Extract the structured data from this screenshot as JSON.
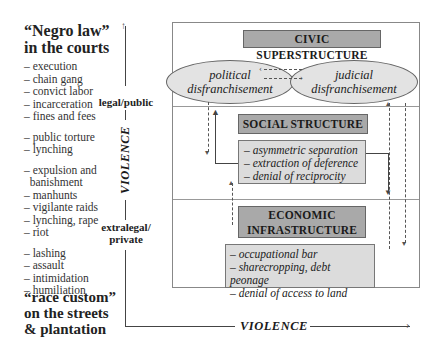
{
  "left_panel": {
    "top_heading": [
      "“Negro law”",
      "in the courts"
    ],
    "groups": [
      [
        "– execution",
        "– chain gang",
        "– convict labor",
        "– incarceration",
        "– fines and fees"
      ],
      [
        "– public torture",
        "– lynching"
      ],
      [
        "– expulsion and",
        "  banishment",
        "– manhunts",
        "– vigilante raids",
        "– lynching, rape",
        "– riot"
      ],
      [
        "– lashing",
        "– assault",
        "– intimidation",
        "– humiliation"
      ]
    ],
    "bottom_heading": [
      "“race custom”",
      "on the streets",
      "& plantation"
    ]
  },
  "vertical_axis": {
    "top_label": "legal/public",
    "axis_title": "VIOLENCE",
    "bottom_label_line1": "extralegal/",
    "bottom_label_line2": "private"
  },
  "horizontal_axis": {
    "axis_title": "VIOLENCE"
  },
  "civic": {
    "title": "CIVIC SUPERSTRUCTURE",
    "ellipse_left": [
      "political",
      "disfranchisement"
    ],
    "ellipse_right": [
      "judicial",
      "disfranchisement"
    ]
  },
  "social": {
    "title": "SOCIAL STRUCTURE",
    "items": [
      "– asymmetric separation",
      "– extraction of deference",
      "– denial of reciprocity"
    ]
  },
  "economic": {
    "title_line1": "ECONOMIC",
    "title_line2": "INFRASTRUCTURE",
    "items": [
      "– occupational bar",
      "– sharecropping, debt peonage",
      "– denial of access to land"
    ]
  },
  "colors": {
    "title_box": "#a9a9a9",
    "detail_box": "#dcdcdc",
    "ellipse": "#e3e3e3"
  }
}
